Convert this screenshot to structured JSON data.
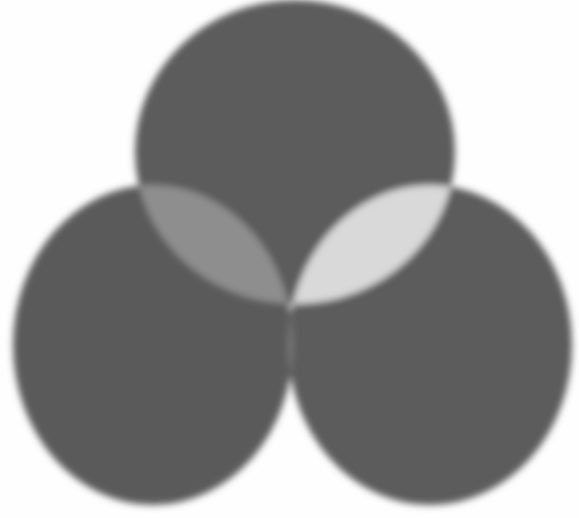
{
  "diagram": {
    "type": "venn-3",
    "background": "#fefefe",
    "sets": [
      {
        "id": "top",
        "cx": 295,
        "cy": 152,
        "rx": 160,
        "ry": 152,
        "color": "#5b5b5b"
      },
      {
        "id": "left",
        "cx": 153,
        "cy": 345,
        "rx": 140,
        "ry": 160,
        "color": "#5a5a5a"
      },
      {
        "id": "right",
        "cx": 430,
        "cy": 345,
        "rx": 142,
        "ry": 160,
        "color": "#5c5c5c"
      }
    ],
    "intersections": {
      "top_left": "#8e8e8e",
      "top_right": "#d9d9d9",
      "left_right": "#7c7c7c",
      "all_three": "#ffffff"
    }
  }
}
